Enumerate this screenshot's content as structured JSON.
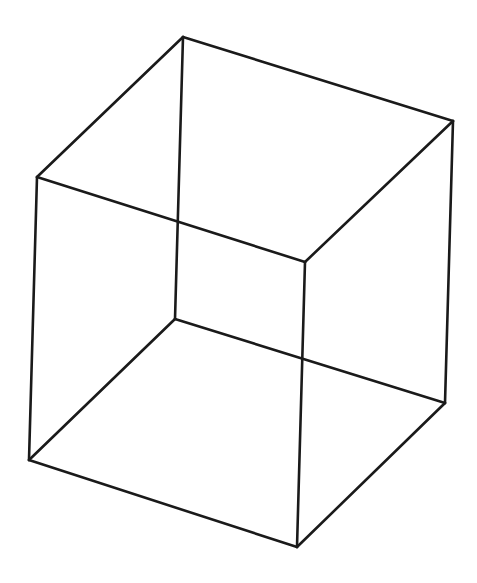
{
  "figure": {
    "type": "wireframe-cube",
    "stroke_color": "#1a1a1a",
    "background": "#ffffff",
    "vertices": {
      "top_back": [
        183,
        37
      ],
      "top_left": [
        37,
        177
      ],
      "top_right": [
        453,
        121
      ],
      "top_front": [
        305,
        262
      ],
      "bottom_back": [
        175,
        319
      ],
      "bottom_left": [
        29,
        460
      ],
      "bottom_right": [
        445,
        403
      ],
      "bottom_front": [
        297,
        547
      ]
    },
    "edges": [
      [
        "top_back",
        "top_left"
      ],
      [
        "top_back",
        "top_right"
      ],
      [
        "top_left",
        "top_front"
      ],
      [
        "top_right",
        "top_front"
      ],
      [
        "bottom_back",
        "bottom_left"
      ],
      [
        "bottom_back",
        "bottom_right"
      ],
      [
        "bottom_left",
        "bottom_front"
      ],
      [
        "bottom_right",
        "bottom_front"
      ],
      [
        "top_back",
        "bottom_back"
      ],
      [
        "top_left",
        "bottom_left"
      ],
      [
        "top_right",
        "bottom_right"
      ],
      [
        "top_front",
        "bottom_front"
      ]
    ]
  }
}
